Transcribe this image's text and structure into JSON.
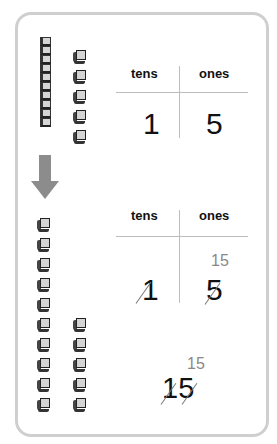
{
  "top_model": {
    "tens_rods": 1,
    "rod_units": 10,
    "ones_cubes": 5
  },
  "top_chart": {
    "headers": {
      "tens": "tens",
      "ones": "ones"
    },
    "tens_digit": "1",
    "ones_digit": "5"
  },
  "arrow": {
    "direction": "down",
    "color": "#8c8c8c"
  },
  "bottom_model": {
    "left_column_cubes": 10,
    "right_column_cubes": 5
  },
  "bottom_chart": {
    "headers": {
      "tens": "tens",
      "ones": "ones"
    },
    "tens_digit": "1",
    "ones_digit": "5",
    "regrouped_ones": "15",
    "tens_crossed": true,
    "ones_crossed": true
  },
  "final": {
    "regrouped_label": "15",
    "number": "15",
    "crossed": true
  }
}
